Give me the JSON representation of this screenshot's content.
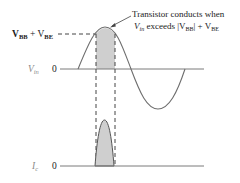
{
  "diagram": {
    "annotation": {
      "line1": "Transistor conducts when",
      "line2_prefix": "V",
      "line2_prefix_sub": "in",
      "line2_mid": " exceeds |V",
      "line2_bb_sub": "BB",
      "line2_plus": "| + V",
      "line2_be_sub": "BE"
    },
    "threshold_label": {
      "v1": "V",
      "v1_sub": "BB",
      "plus": " + V",
      "v2_sub": "BE"
    },
    "vin_axis": {
      "label": "V",
      "label_sub": "in",
      "zero": "0"
    },
    "ic_axis": {
      "label": "I",
      "label_sub": "c",
      "zero": "0"
    },
    "colors": {
      "curve": "#6e6e6e",
      "axis": "#7a7a7a",
      "shade": "#cfcfcf",
      "text": "#222222",
      "label_gray": "#8a8a8a",
      "dash": "#444444"
    }
  }
}
